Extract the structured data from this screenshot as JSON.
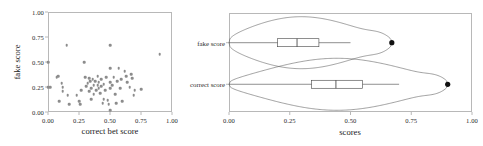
{
  "figure": {
    "background": "#ffffff",
    "axis_color": "#b8b8b8",
    "point_color": "#8c8c8c",
    "outlier_color": "#111111"
  },
  "chart_data": [
    {
      "type": "scatter",
      "panel": "left",
      "title": "",
      "xlabel": "correct bet score",
      "ylabel": "fake score",
      "xlim": [
        0.0,
        1.0
      ],
      "ylim": [
        0.0,
        1.0
      ],
      "xticks": [
        0.0,
        0.25,
        0.5,
        0.75,
        1.0
      ],
      "yticks": [
        0.0,
        0.25,
        0.5,
        0.75,
        1.0
      ],
      "xticklabels": [
        "0.00",
        "0.25",
        "0.50",
        "0.75",
        "1.00"
      ],
      "yticklabels": [
        "0.00",
        "0.25",
        "0.50",
        "0.75",
        "1.00"
      ],
      "grid": false,
      "legend": null,
      "marker": "circle",
      "points": [
        [
          0.0,
          0.5
        ],
        [
          0.0,
          0.25
        ],
        [
          0.02,
          0.25
        ],
        [
          0.07,
          0.35
        ],
        [
          0.08,
          0.36
        ],
        [
          0.09,
          0.11
        ],
        [
          0.11,
          0.29
        ],
        [
          0.12,
          0.21
        ],
        [
          0.12,
          0.25
        ],
        [
          0.15,
          0.67
        ],
        [
          0.16,
          0.17
        ],
        [
          0.17,
          0.08
        ],
        [
          0.23,
          0.17
        ],
        [
          0.25,
          0.11
        ],
        [
          0.26,
          0.08
        ],
        [
          0.27,
          0.22
        ],
        [
          0.29,
          0.5
        ],
        [
          0.3,
          0.35
        ],
        [
          0.31,
          0.26
        ],
        [
          0.32,
          0.29
        ],
        [
          0.33,
          0.34
        ],
        [
          0.33,
          0.21
        ],
        [
          0.34,
          0.31
        ],
        [
          0.35,
          0.24
        ],
        [
          0.35,
          0.13
        ],
        [
          0.36,
          0.33
        ],
        [
          0.37,
          0.27
        ],
        [
          0.37,
          0.18
        ],
        [
          0.38,
          0.31
        ],
        [
          0.39,
          0.22
        ],
        [
          0.4,
          0.36
        ],
        [
          0.4,
          0.27
        ],
        [
          0.41,
          0.24
        ],
        [
          0.41,
          0.3
        ],
        [
          0.42,
          0.19
        ],
        [
          0.43,
          0.33
        ],
        [
          0.43,
          0.26
        ],
        [
          0.44,
          0.09
        ],
        [
          0.45,
          0.28
        ],
        [
          0.45,
          0.13
        ],
        [
          0.46,
          0.22
        ],
        [
          0.47,
          0.35
        ],
        [
          0.48,
          0.12
        ],
        [
          0.49,
          0.08
        ],
        [
          0.5,
          0.67
        ],
        [
          0.5,
          0.44
        ],
        [
          0.5,
          0.3
        ],
        [
          0.5,
          0.24
        ],
        [
          0.5,
          0.02
        ],
        [
          0.52,
          0.27
        ],
        [
          0.53,
          0.35
        ],
        [
          0.54,
          0.18
        ],
        [
          0.55,
          0.09
        ],
        [
          0.56,
          0.31
        ],
        [
          0.57,
          0.44
        ],
        [
          0.58,
          0.24
        ],
        [
          0.59,
          0.33
        ],
        [
          0.6,
          0.11
        ],
        [
          0.62,
          0.41
        ],
        [
          0.63,
          0.36
        ],
        [
          0.64,
          0.3
        ],
        [
          0.66,
          0.25
        ],
        [
          0.67,
          0.38
        ],
        [
          0.68,
          0.34
        ],
        [
          0.69,
          0.17
        ],
        [
          0.7,
          0.22
        ],
        [
          0.75,
          0.23
        ],
        [
          0.9,
          0.58
        ]
      ]
    },
    {
      "type": "violin",
      "panel": "right",
      "title": "",
      "xlabel": "scores",
      "ylabel": "",
      "xlim": [
        0.0,
        1.0
      ],
      "xticks": [
        0.0,
        0.25,
        0.5,
        0.75,
        1.0
      ],
      "xticklabels": [
        "0.00",
        "0.25",
        "0.50",
        "0.75",
        "1.00"
      ],
      "grid": false,
      "legend": null,
      "orientation": "horizontal",
      "categories": [
        "fake score",
        "correct score"
      ],
      "series": [
        {
          "name": "fake score",
          "min": 0.0,
          "q1": 0.2,
          "median": 0.28,
          "q3": 0.37,
          "whisker_low": 0.0,
          "whisker_high": 0.5,
          "max": 0.67,
          "outliers": [
            0.67
          ],
          "density_peak": 0.27
        },
        {
          "name": "correct score",
          "min": 0.0,
          "q1": 0.34,
          "median": 0.44,
          "q3": 0.55,
          "whisker_low": 0.0,
          "whisker_high": 0.7,
          "max": 0.9,
          "outliers": [
            0.9
          ],
          "density_peak": 0.44
        }
      ]
    }
  ]
}
